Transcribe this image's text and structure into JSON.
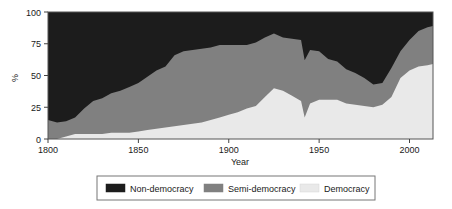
{
  "chart_data": {
    "type": "area",
    "stacked": true,
    "title": "",
    "xlabel": "Year",
    "ylabel": "%",
    "xlim": [
      1800,
      2013
    ],
    "ylim": [
      0,
      100
    ],
    "xticks": [
      1800,
      1850,
      1900,
      1950,
      2000
    ],
    "yticks": [
      0,
      25,
      50,
      75,
      100
    ],
    "grid": false,
    "legend_position": "below",
    "legend": [
      "Non-democracy",
      "Semi-democracy",
      "Democracy"
    ],
    "colors": {
      "Non-democracy": "#1c1c1c",
      "Semi-democracy": "#808080",
      "Democracy": "#e9e9e9"
    },
    "stack_order_bottom_to_top": [
      "Democracy",
      "Semi-democracy",
      "Non-democracy"
    ],
    "x": [
      1800,
      1805,
      1810,
      1815,
      1820,
      1825,
      1830,
      1835,
      1840,
      1845,
      1850,
      1855,
      1860,
      1865,
      1870,
      1875,
      1880,
      1885,
      1890,
      1895,
      1900,
      1905,
      1910,
      1915,
      1920,
      1925,
      1930,
      1935,
      1940,
      1942,
      1945,
      1950,
      1955,
      1960,
      1965,
      1970,
      1975,
      1980,
      1985,
      1990,
      1995,
      2000,
      2005,
      2010,
      2013
    ],
    "series": [
      {
        "name": "Democracy",
        "values": [
          0,
          0,
          2,
          4,
          4,
          4,
          4,
          5,
          5,
          5,
          6,
          7,
          8,
          9,
          10,
          11,
          12,
          13,
          15,
          17,
          19,
          21,
          24,
          26,
          33,
          40,
          38,
          34,
          30,
          17,
          28,
          31,
          31,
          31,
          28,
          27,
          26,
          25,
          27,
          33,
          48,
          54,
          57,
          58,
          59
        ]
      },
      {
        "name": "Semi-democracy",
        "values": [
          15,
          13,
          12,
          13,
          20,
          26,
          28,
          31,
          33,
          36,
          38,
          42,
          46,
          48,
          56,
          58,
          58,
          58,
          57,
          57,
          55,
          53,
          50,
          50,
          47,
          43,
          42,
          45,
          48,
          45,
          42,
          38,
          32,
          30,
          27,
          25,
          22,
          18,
          17,
          23,
          21,
          24,
          28,
          30,
          30
        ]
      },
      {
        "name": "Non-democracy",
        "values": [
          85,
          87,
          86,
          83,
          76,
          70,
          68,
          64,
          62,
          59,
          56,
          51,
          46,
          43,
          34,
          31,
          30,
          29,
          28,
          26,
          26,
          26,
          26,
          24,
          20,
          17,
          20,
          21,
          22,
          38,
          30,
          31,
          37,
          39,
          45,
          48,
          52,
          57,
          56,
          44,
          31,
          22,
          15,
          12,
          11
        ]
      }
    ],
    "cumulative_upper_bounds": {
      "democracy_top": [
        0,
        0,
        2,
        4,
        4,
        4,
        4,
        5,
        5,
        5,
        6,
        7,
        8,
        9,
        10,
        11,
        12,
        13,
        15,
        17,
        19,
        21,
        24,
        26,
        33,
        40,
        38,
        34,
        30,
        17,
        28,
        31,
        31,
        31,
        28,
        27,
        26,
        25,
        27,
        33,
        48,
        54,
        57,
        58,
        59
      ],
      "semi_top": [
        15,
        13,
        14,
        17,
        24,
        30,
        32,
        36,
        38,
        41,
        44,
        49,
        54,
        57,
        66,
        69,
        70,
        71,
        72,
        74,
        74,
        74,
        74,
        76,
        80,
        83,
        80,
        79,
        78,
        62,
        70,
        69,
        63,
        61,
        55,
        52,
        48,
        43,
        44,
        56,
        69,
        78,
        85,
        88,
        89
      ]
    }
  },
  "axis": {
    "ylabel": "%",
    "xlabel": "Year",
    "xtick_labels": [
      "1800",
      "1850",
      "1900",
      "1950",
      "2000"
    ],
    "ytick_labels": [
      "0",
      "25",
      "50",
      "75",
      "100"
    ]
  },
  "legend": {
    "items": [
      {
        "label": "Non-democracy",
        "color": "#1c1c1c"
      },
      {
        "label": "Semi-democracy",
        "color": "#808080"
      },
      {
        "label": "Democracy",
        "color": "#e9e9e9"
      }
    ]
  }
}
